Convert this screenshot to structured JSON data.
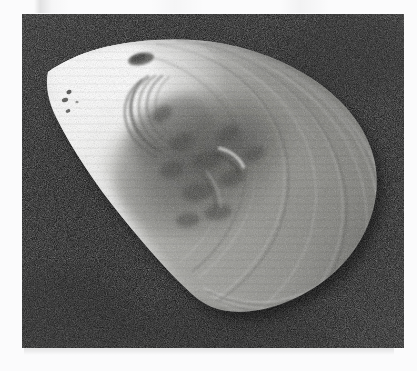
{
  "page": {
    "background_color": "#fbfbfc",
    "width": 417,
    "height": 371,
    "caption": ""
  },
  "photo": {
    "alt_text": "Black and white photograph of a single bivalve mollusc shell valve, exterior view, lying on a dark background",
    "subject": "bivalve shell valve",
    "orientation": "anterior pointed end at upper left, posterior rounded end at right",
    "frame": {
      "x": 22,
      "y": 14,
      "width": 382,
      "height": 334
    },
    "background_color": "#0c0c0c",
    "background_color_light": "#232323",
    "grain": "film-grain-noise",
    "tones": {
      "highlight": "#fdfdfd",
      "light": "#e2e2e0",
      "midtone": "#9a9a96",
      "shadow": "#5c5c59",
      "dark": "#2e2e2c"
    },
    "features": [
      {
        "name": "anterior-tip",
        "label": "Anterior tip (bright white, pointed)"
      },
      {
        "name": "umbo",
        "label": "Umbo / beak with nested growth arcs"
      },
      {
        "name": "dorsal-margin",
        "label": "Dorsal margin, nearly straight slope"
      },
      {
        "name": "posterior-margin",
        "label": "Posterior margin, broadly rounded"
      },
      {
        "name": "ventral-margin",
        "label": "Ventral margin, long gentle curve"
      },
      {
        "name": "growth-rings",
        "label": "Concentric growth lines"
      },
      {
        "name": "eroded-patch",
        "label": "Dark eroded / mottled patch near centre"
      },
      {
        "name": "speckles",
        "label": "Small dark speckles near anterior tip"
      }
    ]
  }
}
